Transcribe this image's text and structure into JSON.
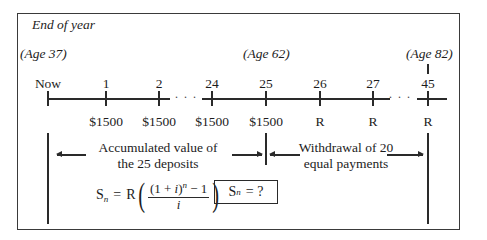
{
  "diagram": {
    "header": "End of year",
    "ages": [
      {
        "label": "(Age 37)",
        "x": 20
      },
      {
        "label": "(Age 62)",
        "x": 245
      },
      {
        "label": "(Age 82)",
        "x": 407
      }
    ],
    "ticks": [
      {
        "label": "Now",
        "x": 48,
        "payment": ""
      },
      {
        "label": "1",
        "x": 106,
        "payment": "$1500"
      },
      {
        "label": "2",
        "x": 159,
        "payment": "$1500"
      },
      {
        "label": "24",
        "x": 212,
        "payment": "$1500"
      },
      {
        "label": "25",
        "x": 266,
        "payment": "$1500"
      },
      {
        "label": "26",
        "x": 320,
        "payment": "R"
      },
      {
        "label": "27",
        "x": 373,
        "payment": "R"
      },
      {
        "label": "45",
        "x": 428,
        "payment": "R"
      }
    ],
    "ellipsis": "· · ·",
    "accumulation_caption": [
      "Accumulated value of",
      "the 25 deposits"
    ],
    "withdrawal_caption": [
      "Withdrawal of 20",
      "equal payments"
    ],
    "formula": {
      "lhs": "S",
      "lhs_sub": "n",
      "equals": "=",
      "coef": "R",
      "numerator_base": "(1 + ",
      "numerator_i": "i",
      "numerator_close": ")",
      "numerator_exp": "n",
      "numerator_tail": " − 1",
      "denominator": "i"
    },
    "unknown_box": {
      "lhs": "S",
      "lhs_sub": "n",
      "rhs": "= ?"
    }
  }
}
